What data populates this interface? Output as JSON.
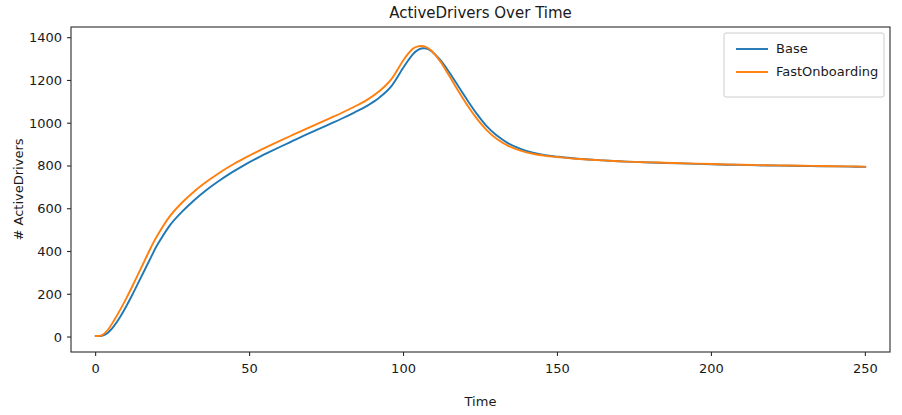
{
  "chart_data": {
    "type": "line",
    "title": "ActiveDrivers Over Time",
    "xlabel": "Time",
    "ylabel": "# ActiveDrivers",
    "xlim": [
      -8,
      258
    ],
    "ylim": [
      -70,
      1450
    ],
    "xticks": [
      0,
      50,
      100,
      150,
      200,
      250
    ],
    "xtick_labels": [
      "0",
      "50",
      "100",
      "150",
      "200",
      "250"
    ],
    "yticks": [
      0,
      200,
      400,
      600,
      800,
      1000,
      1200,
      1400
    ],
    "ytick_labels": [
      "0",
      "200",
      "400",
      "600",
      "800",
      "1000",
      "1200",
      "1400"
    ],
    "grid": false,
    "legend_position": "upper right",
    "colors": {
      "base": "#1f77b4",
      "fast_onboarding": "#ff7f0e",
      "axis": "#2b2b2b",
      "text": "#1a1a1a",
      "background": "#ffffff"
    },
    "x": [
      0,
      2,
      4,
      6,
      8,
      10,
      12,
      14,
      16,
      18,
      20,
      24,
      28,
      32,
      36,
      40,
      44,
      48,
      52,
      56,
      60,
      64,
      68,
      72,
      76,
      80,
      84,
      88,
      92,
      96,
      100,
      103,
      105,
      107,
      109,
      112,
      115,
      118,
      121,
      124,
      127,
      130,
      134,
      138,
      142,
      146,
      150,
      155,
      160,
      165,
      170,
      175,
      180,
      185,
      190,
      195,
      200,
      205,
      210,
      215,
      220,
      225,
      230,
      235,
      240,
      245,
      250
    ],
    "series": [
      {
        "name": "Base",
        "color": "#1f77b4",
        "values": [
          5,
          6,
          20,
          52,
          95,
          145,
          200,
          258,
          316,
          374,
          430,
          520,
          585,
          640,
          688,
          730,
          768,
          802,
          833,
          862,
          890,
          917,
          944,
          970,
          996,
          1022,
          1050,
          1080,
          1118,
          1172,
          1262,
          1322,
          1345,
          1350,
          1338,
          1295,
          1235,
          1168,
          1102,
          1040,
          986,
          946,
          906,
          880,
          862,
          850,
          843,
          836,
          830,
          826,
          822,
          819,
          816,
          814,
          812,
          810,
          808,
          806,
          805,
          803,
          802,
          801,
          800,
          799,
          798,
          797,
          796
        ]
      },
      {
        "name": "FastOnboarding",
        "color": "#ff7f0e",
        "values": [
          5,
          8,
          34,
          78,
          128,
          182,
          240,
          300,
          360,
          420,
          474,
          563,
          628,
          681,
          726,
          766,
          802,
          834,
          864,
          892,
          919,
          945,
          971,
          997,
          1023,
          1049,
          1077,
          1108,
          1148,
          1205,
          1296,
          1348,
          1360,
          1358,
          1340,
          1288,
          1218,
          1146,
          1078,
          1018,
          968,
          930,
          894,
          872,
          857,
          848,
          842,
          835,
          830,
          826,
          822,
          819,
          817,
          815,
          813,
          811,
          809,
          807,
          806,
          804,
          803,
          802,
          801,
          800,
          799,
          798,
          797
        ]
      }
    ]
  },
  "legend": {
    "entries": [
      {
        "label": "Base",
        "color": "#1f77b4"
      },
      {
        "label": "FastOnboarding",
        "color": "#ff7f0e"
      }
    ]
  }
}
